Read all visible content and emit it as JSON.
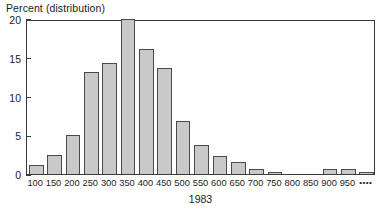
{
  "chart_data": {
    "type": "bar",
    "title": "",
    "ylabel": "Percent (distribution)",
    "xlabel": "1983",
    "ylim": [
      0,
      20
    ],
    "yticks": [
      0,
      5,
      10,
      15,
      20
    ],
    "grid": false,
    "legend": null,
    "bar_fill_color": "#c9c9c9",
    "bar_edge_color": "#4a4a4a",
    "categories": [
      "100",
      "150",
      "200",
      "250",
      "300",
      "350",
      "400",
      "450",
      "500",
      "550",
      "600",
      "650",
      "700",
      "750",
      "800",
      "850",
      "900",
      "950",
      "••••"
    ],
    "values": [
      1.2,
      2.4,
      5.0,
      13.2,
      14.3,
      20.0,
      16.1,
      13.7,
      6.8,
      3.8,
      2.3,
      1.6,
      0.7,
      0.3,
      0.0,
      0.0,
      0.6,
      0.6,
      0.3
    ],
    "series": [
      {
        "name": "1983 distribution",
        "values": [
          1.2,
          2.4,
          5.0,
          13.2,
          14.3,
          20.0,
          16.1,
          13.7,
          6.8,
          3.8,
          2.3,
          1.6,
          0.7,
          0.3,
          0.0,
          0.0,
          0.6,
          0.6,
          0.3
        ]
      }
    ]
  }
}
